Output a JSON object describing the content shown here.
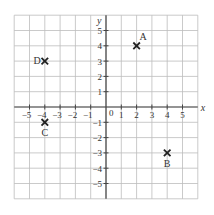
{
  "diagram": {
    "type": "coordinate-grid",
    "x_axis_label": "x",
    "y_axis_label": "y",
    "origin_label": "0",
    "x_range": [
      -6,
      6
    ],
    "y_range": [
      -6,
      6
    ],
    "x_tick_labels": [
      "−5",
      "−4",
      "−3",
      "−2",
      "−1",
      "1",
      "2",
      "3",
      "4",
      "5"
    ],
    "x_tick_values": [
      -5,
      -4,
      -3,
      -2,
      -1,
      1,
      2,
      3,
      4,
      5
    ],
    "y_tick_labels": [
      "5",
      "4",
      "3",
      "2",
      "1",
      "−1",
      "−2",
      "−3",
      "−4",
      "−5"
    ],
    "y_tick_values": [
      5,
      4,
      3,
      2,
      1,
      -1,
      -2,
      -3,
      -4,
      -5
    ],
    "points": [
      {
        "label": "A",
        "x": 2,
        "y": 4,
        "label_pos": "above-right"
      },
      {
        "label": "B",
        "x": 4,
        "y": -3,
        "label_pos": "below"
      },
      {
        "label": "C",
        "x": -4,
        "y": -1,
        "label_pos": "below"
      },
      {
        "label": "D",
        "x": -4,
        "y": 3,
        "label_pos": "left"
      }
    ],
    "colors": {
      "grid": "#bdbdbd",
      "axis": "#444444",
      "marker": "#222222",
      "text": "#333333"
    }
  }
}
